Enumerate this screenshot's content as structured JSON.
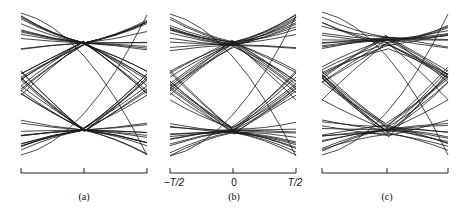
{
  "figure": {
    "panels": [
      {
        "id": "a",
        "caption": "(a)",
        "x0": 21,
        "x1": 147,
        "center_x": 84,
        "tick_labels": [],
        "spread": 0.0,
        "cross_top": 43,
        "cross_bot": 130
      },
      {
        "id": "b",
        "caption": "(b)",
        "x0": 170,
        "x1": 296,
        "center_x": 233,
        "tick_labels": [
          "−T/2",
          "0",
          "T/2"
        ],
        "spread": 4.0,
        "cross_top": 44,
        "cross_bot": 131
      },
      {
        "id": "c",
        "caption": "(c)",
        "x0": 322,
        "x1": 448,
        "center_x": 387,
        "tick_labels": [],
        "spread": 12.0,
        "cross_top": 42,
        "cross_bot": 130
      }
    ],
    "axis_y": 173,
    "trace_color": "#1a1a1a"
  },
  "labels": {
    "b_left": "−T/2",
    "b_mid": "0",
    "b_right": "T/2",
    "cap_a": "(a)",
    "cap_b": "(b)",
    "cap_c": "(c)"
  }
}
